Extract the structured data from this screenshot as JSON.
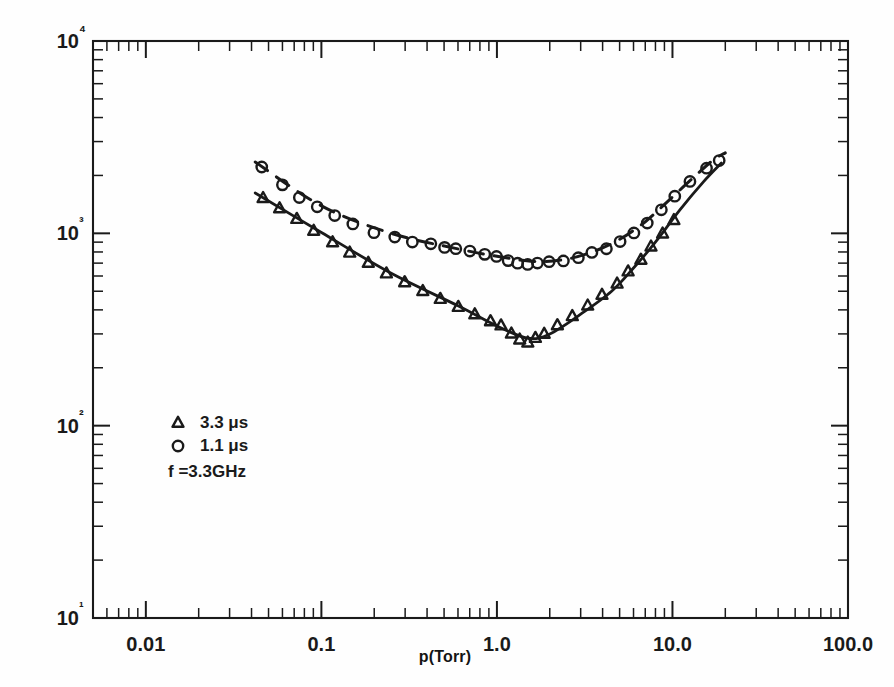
{
  "chart_data": {
    "type": "scatter",
    "title": "",
    "xlabel": "p(Torr)",
    "ylabel": "E(volts/cm)",
    "xscale": "log",
    "yscale": "log",
    "xlim": [
      0.005,
      100.0
    ],
    "ylim": [
      10,
      10000
    ],
    "grid": false,
    "xticklabels": [
      "0.01",
      "0.1",
      "1.0",
      "10.0",
      "100.0"
    ],
    "xtickvalues": [
      0.01,
      0.1,
      1.0,
      10.0,
      100.0
    ],
    "yticklabels": [
      "10¹",
      "10²",
      "10³",
      "10⁴"
    ],
    "ytickvalues": [
      10,
      100,
      1000,
      10000
    ],
    "legend_position": "lower-left-inside",
    "annotations": [
      "f =3.3GHz"
    ],
    "series": [
      {
        "name": "3.3 μs",
        "marker": "triangle",
        "linestyle": "solid",
        "points": [
          [
            0.047,
            1520
          ],
          [
            0.058,
            1340
          ],
          [
            0.072,
            1180
          ],
          [
            0.09,
            1020
          ],
          [
            0.115,
            900
          ],
          [
            0.145,
            790
          ],
          [
            0.185,
            700
          ],
          [
            0.235,
            620
          ],
          [
            0.3,
            560
          ],
          [
            0.38,
            500
          ],
          [
            0.48,
            455
          ],
          [
            0.6,
            415
          ],
          [
            0.75,
            380
          ],
          [
            0.92,
            350
          ],
          [
            1.05,
            330
          ],
          [
            1.2,
            300
          ],
          [
            1.35,
            278
          ],
          [
            1.5,
            272
          ],
          [
            1.65,
            285
          ],
          [
            1.85,
            300
          ],
          [
            2.2,
            330
          ],
          [
            2.7,
            370
          ],
          [
            3.3,
            420
          ],
          [
            4.0,
            480
          ],
          [
            4.8,
            545
          ],
          [
            5.6,
            630
          ],
          [
            6.6,
            730
          ],
          [
            7.6,
            850
          ],
          [
            8.8,
            990
          ],
          [
            10.2,
            1160
          ]
        ],
        "curve": [
          [
            0.042,
            1620
          ],
          [
            0.1,
            1010
          ],
          [
            0.25,
            620
          ],
          [
            0.6,
            420
          ],
          [
            1.0,
            330
          ],
          [
            1.5,
            285
          ],
          [
            2.0,
            300
          ],
          [
            3.0,
            380
          ],
          [
            4.5,
            500
          ],
          [
            6.0,
            660
          ],
          [
            8.0,
            900
          ],
          [
            11.0,
            1320
          ],
          [
            15.0,
            1850
          ],
          [
            19.0,
            2320
          ]
        ]
      },
      {
        "name": "1.1 μs",
        "marker": "circle",
        "linestyle": "dashed",
        "points": [
          [
            0.046,
            2200
          ],
          [
            0.06,
            1780
          ],
          [
            0.075,
            1540
          ],
          [
            0.095,
            1380
          ],
          [
            0.12,
            1230
          ],
          [
            0.15,
            1120
          ],
          [
            0.2,
            1010
          ],
          [
            0.26,
            960
          ],
          [
            0.33,
            900
          ],
          [
            0.42,
            880
          ],
          [
            0.5,
            850
          ],
          [
            0.58,
            830
          ],
          [
            0.7,
            810
          ],
          [
            0.85,
            780
          ],
          [
            1.0,
            755
          ],
          [
            1.15,
            720
          ],
          [
            1.3,
            700
          ],
          [
            1.5,
            690
          ],
          [
            1.7,
            700
          ],
          [
            2.0,
            710
          ],
          [
            2.4,
            720
          ],
          [
            2.9,
            750
          ],
          [
            3.5,
            790
          ],
          [
            4.2,
            830
          ],
          [
            5.0,
            900
          ],
          [
            6.0,
            1000
          ],
          [
            7.2,
            1130
          ],
          [
            8.6,
            1320
          ],
          [
            10.3,
            1560
          ],
          [
            12.5,
            1850
          ],
          [
            15.5,
            2180
          ],
          [
            18.5,
            2380
          ]
        ],
        "curve": [
          [
            0.042,
            2350
          ],
          [
            0.1,
            1390
          ],
          [
            0.25,
            1000
          ],
          [
            0.6,
            830
          ],
          [
            1.0,
            760
          ],
          [
            1.6,
            715
          ],
          [
            2.4,
            730
          ],
          [
            3.5,
            800
          ],
          [
            5.0,
            930
          ],
          [
            7.0,
            1150
          ],
          [
            9.5,
            1480
          ],
          [
            13.0,
            1930
          ],
          [
            17.0,
            2400
          ],
          [
            20.0,
            2620
          ]
        ]
      }
    ]
  },
  "legend": {
    "entries": [
      {
        "marker": "triangle",
        "label": "3.3 μs"
      },
      {
        "marker": "circle",
        "label": "1.1 μs"
      }
    ],
    "note": "f =3.3GHz"
  },
  "axes": {
    "x_title": "p(Torr)",
    "y_title": "E(volts/cm)"
  },
  "style": {
    "ink": "#1a1a1a",
    "background": "#ffffff"
  }
}
